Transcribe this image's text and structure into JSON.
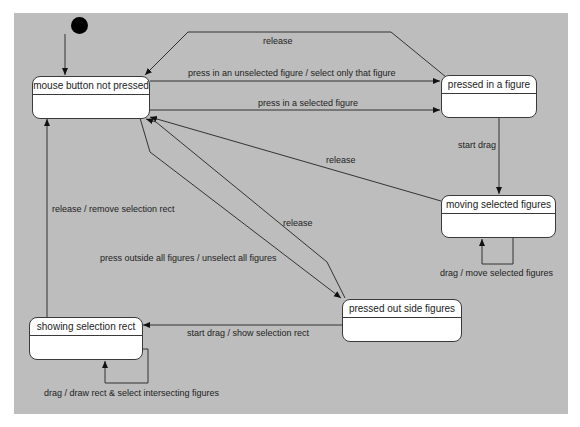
{
  "diagram": {
    "type": "UML state machine",
    "initial_state": "mouse button not pressed",
    "states": [
      {
        "id": "s1",
        "name": "mouse button not pressed"
      },
      {
        "id": "s2",
        "name": "pressed in a figure"
      },
      {
        "id": "s3",
        "name": "moving selected figures"
      },
      {
        "id": "s4",
        "name": "pressed out side figures"
      },
      {
        "id": "s5",
        "name": "showing selection rect"
      }
    ],
    "transitions": [
      {
        "from": "s2",
        "to": "s1",
        "label": "release"
      },
      {
        "from": "s1",
        "to": "s2",
        "label": "press in an unselected figure / select only that figure"
      },
      {
        "from": "s1",
        "to": "s2",
        "label": "press in a selected figure"
      },
      {
        "from": "s2",
        "to": "s3",
        "label": "start drag"
      },
      {
        "from": "s3",
        "to": "s1",
        "label": "release"
      },
      {
        "from": "s3",
        "to": "s3",
        "label": "drag / move selected figures"
      },
      {
        "from": "s4",
        "to": "s1",
        "label": "release"
      },
      {
        "from": "s1",
        "to": "s4",
        "label": "press outside all figures / unselect all figures"
      },
      {
        "from": "s5",
        "to": "s1",
        "label": "release / remove selection rect"
      },
      {
        "from": "s4",
        "to": "s5",
        "label": "start drag / show selection rect"
      },
      {
        "from": "s5",
        "to": "s5",
        "label": "drag / draw rect & select intersecting figures"
      }
    ]
  },
  "colors": {
    "background": "#bdbdbd",
    "state_fill": "#ffffff",
    "line": "#3a3a3a"
  }
}
